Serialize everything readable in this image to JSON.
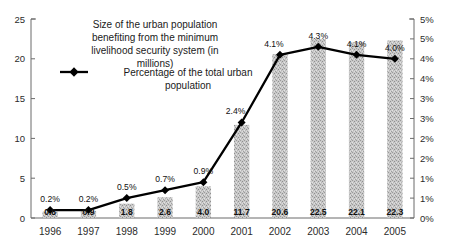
{
  "chart_data": {
    "type": "bar",
    "title": "",
    "subtitle": "",
    "xlabel": "",
    "ylabel": "",
    "categories": [
      "1996",
      "1997",
      "1998",
      "1999",
      "2000",
      "2001",
      "2002",
      "2003",
      "2004",
      "2005"
    ],
    "grid": false,
    "legend_position": "top-center-inside",
    "left_axis": {
      "label": "",
      "ylim": [
        0,
        25
      ],
      "ticks": [
        0,
        5,
        10,
        15,
        20,
        25
      ],
      "tick_labels": [
        "0",
        "5",
        "10",
        "15",
        "20",
        "25"
      ]
    },
    "right_axis": {
      "label": "",
      "ylim": [
        0,
        5
      ],
      "ticks": [
        0,
        0.5,
        1,
        1.5,
        2,
        2.5,
        3,
        3.5,
        4,
        4.5,
        5
      ],
      "tick_labels": [
        "0%",
        "1%",
        "1%",
        "2%",
        "2%",
        "3%",
        "3%",
        "4%",
        "4%",
        "5%",
        "5%"
      ]
    },
    "series": [
      {
        "name": "Size of the urban population benefiting from the minimum livelihood security system (in millions)",
        "type": "bar",
        "axis": "left",
        "color": "#b0b0b0",
        "values": [
          0.8,
          0.9,
          1.8,
          2.6,
          4.0,
          11.7,
          20.6,
          22.5,
          22.1,
          22.3
        ],
        "data_labels": [
          "0.8",
          "0.9",
          "1.8",
          "2.6",
          "4.0",
          "11.7",
          "20.6",
          "22.5",
          "22.1",
          "22.3"
        ]
      },
      {
        "name": "Percentage of the total urban population",
        "type": "line",
        "axis": "right",
        "color": "#000000",
        "marker": "diamond",
        "values": [
          0.2,
          0.2,
          0.5,
          0.7,
          0.9,
          2.4,
          4.1,
          4.3,
          4.1,
          4.0
        ],
        "data_labels": [
          "0.2%",
          "0.2%",
          "0.5%",
          "0.7%",
          "0.9%",
          "2.4%",
          "4.1%",
          "4.3%",
          "4.1%",
          "4.0%"
        ]
      }
    ]
  },
  "legend": {
    "bar_entry_label": "Size of the urban population benefiting from the minimum livelihood security system (in millions)",
    "bar_entry_lines": [
      "Size of the urban population",
      "benefiting from the minimum",
      "livelihood security system (in",
      "millions)"
    ],
    "line_entry_label": "Percentage of the total urban population",
    "line_entry_lines": [
      "Percentage of the total urban",
      "population"
    ]
  }
}
